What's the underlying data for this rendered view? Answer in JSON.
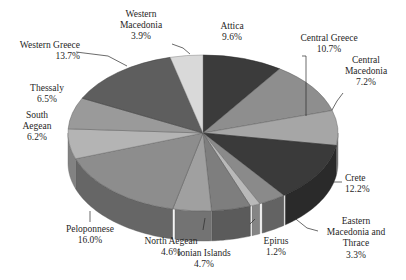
{
  "chart_data": {
    "type": "pie",
    "title": "",
    "subtitle": "",
    "xlabel": "",
    "ylabel": "",
    "legend_position": "none",
    "grid": false,
    "style": "3d-exploded-none-grayscale",
    "units": "percent",
    "start_angle_deg": 0,
    "direction": "clockwise",
    "categories": [
      "Attica",
      "Central Greece",
      "Central Macedonia",
      "Crete",
      "Eastern Macedonia and Thrace",
      "Epirus",
      "Ionian Islands",
      "North Aegean",
      "Peloponnese",
      "South Aegean",
      "Thessaly",
      "Western Greece",
      "Western Macedonia"
    ],
    "values": [
      9.6,
      10.7,
      7.2,
      12.2,
      3.3,
      1.2,
      4.7,
      4.6,
      16.0,
      6.2,
      6.5,
      13.7,
      3.9
    ],
    "value_labels": [
      "9.6%",
      "10.7%",
      "7.2%",
      "12.2%",
      "3.3%",
      "1.2%",
      "4.7%",
      "4.6%",
      "16.0%",
      "6.2%",
      "6.5%",
      "13.7%",
      "3.9%"
    ],
    "slice_colors": [
      "#3b3b3b",
      "#8e8e8e",
      "#a6a6a6",
      "#3a3a3a",
      "#8a8a8a",
      "#b9b9b9",
      "#7e7e7e",
      "#a0a0a0",
      "#8d8d8d",
      "#b4b4b4",
      "#9a9a9a",
      "#5e5e5e",
      "#d9d9d9"
    ],
    "slices": [
      {
        "label": "Attica",
        "value": 9.6,
        "value_label": "9.6%",
        "color": "#3b3b3b"
      },
      {
        "label": "Central Greece",
        "value": 10.7,
        "value_label": "10.7%",
        "color": "#8e8e8e"
      },
      {
        "label": "Central Macedonia",
        "value": 7.2,
        "value_label": "7.2%",
        "color": "#a6a6a6"
      },
      {
        "label": "Crete",
        "value": 12.2,
        "value_label": "12.2%",
        "color": "#3a3a3a"
      },
      {
        "label": "Eastern Macedonia and Thrace",
        "value": 3.3,
        "value_label": "3.3%",
        "color": "#8a8a8a"
      },
      {
        "label": "Epirus",
        "value": 1.2,
        "value_label": "1.2%",
        "color": "#b9b9b9"
      },
      {
        "label": "Ionian Islands",
        "value": 4.7,
        "value_label": "4.7%",
        "color": "#7e7e7e"
      },
      {
        "label": "North Aegean",
        "value": 4.6,
        "value_label": "4.6%",
        "color": "#a0a0a0"
      },
      {
        "label": "Peloponnese",
        "value": 16.0,
        "value_label": "16.0%",
        "color": "#8d8d8d"
      },
      {
        "label": "South Aegean",
        "value": 6.2,
        "value_label": "6.2%",
        "color": "#b4b4b4"
      },
      {
        "label": "Thessaly",
        "value": 6.5,
        "value_label": "6.5%",
        "color": "#9a9a9a"
      },
      {
        "label": "Western Greece",
        "value": 13.7,
        "value_label": "13.7%",
        "color": "#5e5e5e"
      },
      {
        "label": "Western Macedonia",
        "value": 3.9,
        "value_label": "3.9%",
        "color": "#d9d9d9"
      }
    ]
  },
  "labels": {
    "western_macedonia": {
      "name_line1": "Western",
      "name_line2": "Macedonia",
      "pct": "3.9%"
    },
    "attica": {
      "name": "Attica",
      "pct": "9.6%"
    },
    "central_greece": {
      "name": "Central Greece",
      "pct": "10.7%"
    },
    "central_macedonia": {
      "name_line1": "Central",
      "name_line2": "Macedonia",
      "pct": "7.2%"
    },
    "crete": {
      "name": "Crete",
      "pct": "12.2%"
    },
    "eastern_macedonia_thrace": {
      "name_line1": "Eastern",
      "name_line2": "Macedonia and",
      "name_line3": "Thrace",
      "pct": "3.3%"
    },
    "epirus": {
      "name": "Epirus",
      "pct": "1.2%"
    },
    "ionian_islands": {
      "name": "Ionian Islands",
      "pct": "4.7%"
    },
    "north_aegean": {
      "name": "North Aegean",
      "pct": "4.6%"
    },
    "peloponnese": {
      "name": "Peloponnese",
      "pct": "16.0%"
    },
    "south_aegean": {
      "name_line1": "South",
      "name_line2": "Aegean",
      "pct": "6.2%"
    },
    "thessaly": {
      "name": "Thessaly",
      "pct": "6.5%"
    },
    "western_greece": {
      "name": "Western Greece",
      "pct": "13.7%"
    }
  }
}
